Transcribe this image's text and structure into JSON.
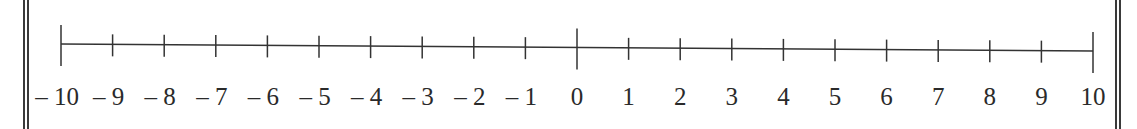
{
  "number_line": {
    "min": -10,
    "max": 10,
    "step": 1,
    "labels": [
      "– 10",
      "– 9",
      "– 8",
      "– 7",
      "– 6",
      "– 5",
      "– 4",
      "– 3",
      "– 2",
      "– 1",
      "0",
      "1",
      "2",
      "3",
      "4",
      "5",
      "6",
      "7",
      "8",
      "9",
      "10"
    ],
    "line_color": "#333333",
    "text_color": "#2a2a2a"
  }
}
